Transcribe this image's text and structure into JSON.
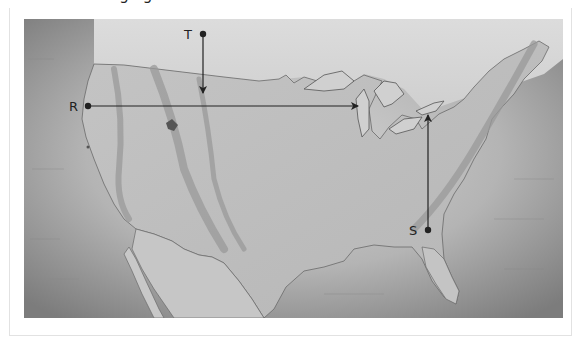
{
  "header": {
    "cropped_text": "ag ag"
  },
  "map": {
    "title": "Map of the contiguous United States",
    "colors": {
      "ocean_dark": "#7f7f7f",
      "ocean_light": "#c9c9c9",
      "land": "#bdbdbd",
      "canada": "#d6d6d6",
      "mountains": "#9a9a9a",
      "lines": "#222222",
      "border": "#6a6a6a"
    },
    "points": [
      {
        "id": "T",
        "label": "T",
        "x": 179,
        "y": 15,
        "arrow_to": [
          179,
          74
        ],
        "direction": "south"
      },
      {
        "id": "R",
        "label": "R",
        "x": 64,
        "y": 87,
        "arrow_to": [
          334,
          87
        ],
        "direction": "east"
      },
      {
        "id": "S",
        "label": "S",
        "x": 404,
        "y": 211,
        "arrow_to": [
          404,
          96
        ],
        "direction": "north"
      }
    ]
  }
}
